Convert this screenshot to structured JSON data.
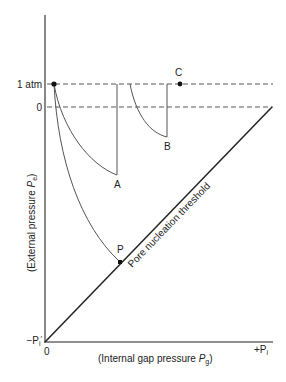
{
  "diagram": {
    "y_axis": {
      "label_prefix": "(External pressure ",
      "label_symbol": "P",
      "label_sub": "e",
      "label_suffix": ")",
      "ticks": [
        "1 atm",
        "0"
      ],
      "bottom_tick_prefix": "−P",
      "bottom_tick_sub": "i",
      "bottom_tick_prime": "′"
    },
    "x_axis": {
      "label_prefix": "(Internal gap pressure ",
      "label_symbol": "P",
      "label_sub": "g",
      "label_suffix": ")",
      "origin_tick": "0",
      "right_tick_prefix": "+P",
      "right_tick_sub": "i"
    },
    "threshold_label": "Pore nucleation threshold",
    "points": {
      "A": "A",
      "B": "B",
      "C": "C",
      "P": "P"
    }
  }
}
